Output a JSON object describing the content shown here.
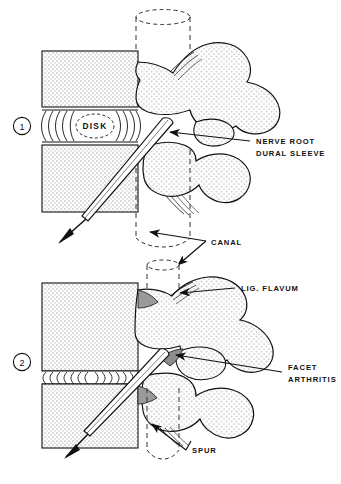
{
  "figure": {
    "type": "medical-line-illustration",
    "panel_count": 2
  },
  "colors": {
    "ink": "#111111",
    "disc_fill": "#ffffff",
    "vertebral_body_fill": "#e9e9e9",
    "bone_stipple_fill": "#e4e4e4",
    "needle_fill": "#ffffff",
    "canal_dash": "#333333",
    "background": "#ffffff"
  },
  "panels": [
    {
      "number": "1",
      "marker": "1",
      "caption_role": "normal anatomy",
      "structures": [
        "vertebral body",
        "disk",
        "canal",
        "nerve root dural sleeve",
        "needle"
      ],
      "labels": [
        {
          "id": "disk",
          "text": "DISK",
          "placement": "inside-disc"
        },
        {
          "id": "nerve-root",
          "line1": "NERVE ROOT",
          "line2": "DURAL SLEEVE",
          "placement": "right"
        }
      ]
    },
    {
      "number": "2",
      "marker": "2",
      "caption_role": "degenerative changes",
      "structures": [
        "collapsed disk",
        "lig. flavum",
        "facet arthritis",
        "spur",
        "canal",
        "needle"
      ],
      "labels": [
        {
          "id": "lig-flavum",
          "text": "LIG. FLAVUM",
          "placement": "right"
        },
        {
          "id": "facet",
          "line1": "FACET",
          "line2": "ARTHRITIS",
          "placement": "right"
        },
        {
          "id": "spur",
          "text": "SPUR",
          "placement": "bottom"
        }
      ]
    }
  ],
  "shared_labels": [
    {
      "id": "canal",
      "text": "CANAL",
      "placement": "center-between-panels"
    }
  ],
  "label_text": {
    "disk": "DISK",
    "nerve_root_l1": "NERVE ROOT",
    "nerve_root_l2": "DURAL SLEEVE",
    "canal": "CANAL",
    "lig_flavum": "LIG. FLAVUM",
    "facet_l1": "FACET",
    "facet_l2": "ARTHRITIS",
    "spur": "SPUR",
    "panel1_number": "1",
    "panel2_number": "2"
  },
  "caption": {
    "text": ""
  }
}
